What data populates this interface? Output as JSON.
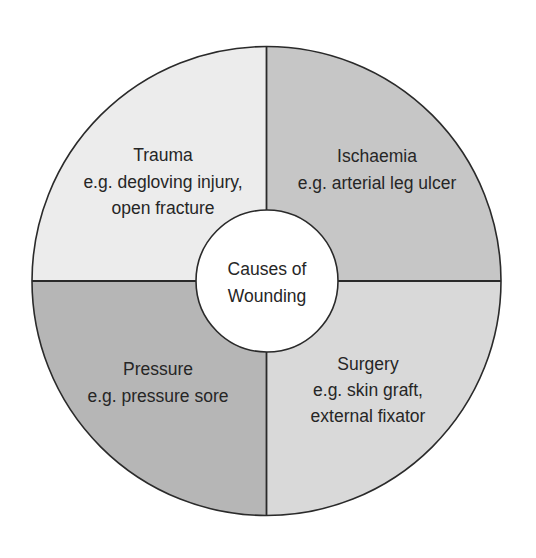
{
  "diagram": {
    "center": {
      "line1": "Causes of",
      "line2": "Wounding"
    },
    "quadrants": [
      {
        "id": "trauma",
        "title": "Trauma",
        "lines": [
          "e.g. degloving injury,",
          "open fracture"
        ],
        "fill": "#ececec"
      },
      {
        "id": "ischaemia",
        "title": "Ischaemia",
        "lines": [
          "e.g. arterial leg ulcer"
        ],
        "fill": "#c6c6c6"
      },
      {
        "id": "pressure",
        "title": "Pressure",
        "lines": [
          "e.g. pressure sore"
        ],
        "fill": "#b6b6b6"
      },
      {
        "id": "surgery",
        "title": "Surgery",
        "lines": [
          "e.g. skin graft,",
          "external fixator"
        ],
        "fill": "#d9d9d9"
      }
    ],
    "stroke": "#2a2a2a"
  }
}
